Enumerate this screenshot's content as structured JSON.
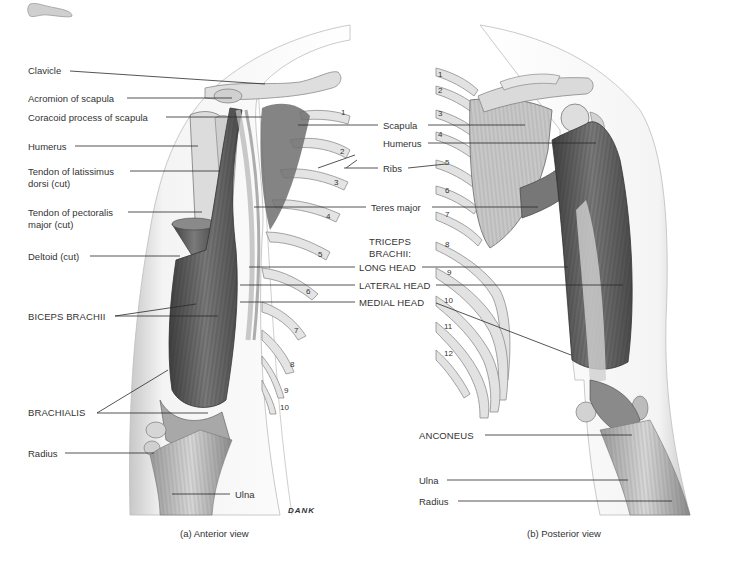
{
  "figure": {
    "captions": {
      "anterior": "(a)  Anterior view",
      "posterior": "(b) Posterior view"
    },
    "artist_signature": "DANK",
    "triceps_group_label_1": "TRICEPS",
    "triceps_group_label_2": "BRACHII:"
  },
  "anterior_labels": [
    {
      "id": "clavicle",
      "text": "Clavicle",
      "x": 28,
      "y": 65
    },
    {
      "id": "acromion",
      "text": "Acromion of scapula",
      "x": 28,
      "y": 93
    },
    {
      "id": "coracoid",
      "text": "Coracoid process of scapula",
      "x": 28,
      "y": 112
    },
    {
      "id": "humerus-a",
      "text": "Humerus",
      "x": 28,
      "y": 141
    },
    {
      "id": "lat-dorsi-1",
      "text": "Tendon of latissimus",
      "x": 28,
      "y": 166
    },
    {
      "id": "lat-dorsi-2",
      "text": "dorsi (cut)",
      "x": 28,
      "y": 178
    },
    {
      "id": "pect-major-1",
      "text": "Tendon of pectoralis",
      "x": 28,
      "y": 207
    },
    {
      "id": "pect-major-2",
      "text": "major (cut)",
      "x": 28,
      "y": 219
    },
    {
      "id": "deltoid",
      "text": "Deltoid (cut)",
      "x": 28,
      "y": 251
    },
    {
      "id": "biceps",
      "text": "BICEPS BRACHII",
      "x": 28,
      "y": 311,
      "caps": true
    },
    {
      "id": "brachialis",
      "text": "BRACHIALIS",
      "x": 28,
      "y": 407,
      "caps": true
    },
    {
      "id": "radius-a",
      "text": "Radius",
      "x": 28,
      "y": 448
    },
    {
      "id": "ulna-a",
      "text": "Ulna",
      "x": 235,
      "y": 489
    }
  ],
  "center_labels": [
    {
      "id": "scapula",
      "text": "Scapula",
      "x": 383,
      "y": 120
    },
    {
      "id": "humerus-p",
      "text": "Humerus",
      "x": 383,
      "y": 138
    },
    {
      "id": "ribs",
      "text": "Ribs",
      "x": 383,
      "y": 163
    },
    {
      "id": "teres-major",
      "text": "Teres major",
      "x": 371,
      "y": 203
    },
    {
      "id": "long-head",
      "text": "LONG HEAD",
      "x": 359,
      "y": 262,
      "caps": true
    },
    {
      "id": "lateral-head",
      "text": "LATERAL HEAD",
      "x": 359,
      "y": 280,
      "caps": true
    },
    {
      "id": "medial-head",
      "text": "MEDIAL HEAD",
      "x": 359,
      "y": 298,
      "caps": true
    }
  ],
  "posterior_labels": [
    {
      "id": "anconeus",
      "text": "ANCONEUS",
      "x": 419,
      "y": 430,
      "caps": true
    },
    {
      "id": "ulna-p",
      "text": "Ulna",
      "x": 419,
      "y": 475
    },
    {
      "id": "radius-p",
      "text": "Radius",
      "x": 419,
      "y": 496
    }
  ],
  "anterior_rib_numbers": [
    "1",
    "2",
    "3",
    "4",
    "5",
    "6",
    "7",
    "8",
    "9",
    "10"
  ],
  "posterior_rib_numbers": [
    "1",
    "2",
    "3",
    "4",
    "5",
    "6",
    "7",
    "8",
    "9",
    "10",
    "11",
    "12"
  ],
  "colors": {
    "background": "#ffffff",
    "text": "#333333",
    "leader_line": "#2a2a2a",
    "skin_outline": "#bdbdbd",
    "muscle_dark": "#5a5a5a",
    "muscle_mid": "#8c8c8c",
    "bone": "#d9d9d9"
  }
}
